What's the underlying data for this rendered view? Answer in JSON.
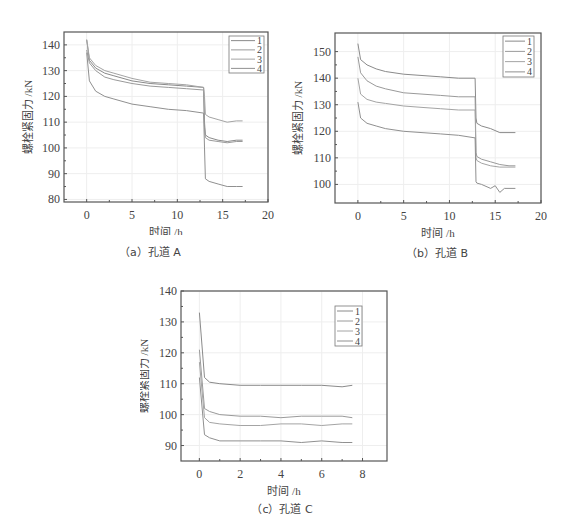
{
  "chart_data": [
    {
      "id": "A",
      "type": "line",
      "title": "",
      "caption": "（a）孔道 A",
      "xlabel": "时间 /h",
      "ylabel": "螺栓紧固力 /kN",
      "xlim": [
        -2.5,
        20
      ],
      "ylim": [
        79,
        145
      ],
      "xticks": [
        0,
        5,
        10,
        15,
        20
      ],
      "yticks": [
        80,
        90,
        100,
        110,
        120,
        130,
        140
      ],
      "grid": true,
      "legend_position": "upper right",
      "series": [
        {
          "name": "1",
          "x": [
            0,
            0.3,
            1,
            2,
            3,
            5,
            7,
            9,
            11,
            12.9,
            13.0,
            13.1,
            13.5,
            14.5,
            15.5,
            16.5,
            17.2
          ],
          "y": [
            142,
            134,
            131,
            129,
            128,
            126,
            125,
            124.5,
            124,
            123.5,
            110,
            105,
            104,
            103,
            102.5,
            103,
            103
          ]
        },
        {
          "name": "2",
          "x": [
            0,
            0.3,
            1,
            2,
            3,
            5,
            7,
            9,
            11,
            12.9,
            13.0,
            13.1,
            13.5,
            14.5,
            15.5,
            16.5,
            17.2
          ],
          "y": [
            138,
            133,
            130,
            127.5,
            126.5,
            125,
            124,
            123.5,
            123,
            122.5,
            108,
            104,
            103,
            102.5,
            102,
            102.5,
            102.5
          ]
        },
        {
          "name": "3",
          "x": [
            0,
            0.3,
            1,
            2,
            3,
            5,
            7,
            9,
            11,
            12.9,
            13.0,
            13.1,
            13.5,
            14.5,
            15.5,
            16.5,
            17.2
          ],
          "y": [
            142,
            135,
            132,
            130,
            129,
            127,
            125.5,
            125,
            124.5,
            123.5,
            120,
            113,
            112,
            111,
            110,
            110.5,
            110.5
          ]
        },
        {
          "name": "4",
          "x": [
            0,
            0.3,
            1,
            2,
            3,
            5,
            7,
            9,
            11,
            12.9,
            13.0,
            13.1,
            13.5,
            14.5,
            15.5,
            16.5,
            17.2
          ],
          "y": [
            137,
            126,
            122,
            120,
            119,
            117,
            116,
            115,
            114.5,
            113.5,
            100,
            88,
            87,
            86,
            85,
            85,
            85
          ]
        }
      ]
    },
    {
      "id": "B",
      "type": "line",
      "title": "",
      "caption": "（b）孔道 B",
      "xlabel": "时间 /h",
      "ylabel": "螺栓紧固力 /kN",
      "xlim": [
        -2.5,
        20
      ],
      "ylim": [
        93,
        157
      ],
      "xticks": [
        0,
        5,
        10,
        15,
        20
      ],
      "yticks": [
        100,
        110,
        120,
        130,
        140,
        150
      ],
      "grid": true,
      "legend_position": "upper right",
      "series": [
        {
          "name": "1",
          "x": [
            0,
            0.3,
            1,
            2,
            3,
            5,
            7,
            9,
            11,
            12.8,
            12.9,
            13.0,
            13.5,
            14.5,
            15.5,
            16.5,
            17.2
          ],
          "y": [
            153,
            147,
            145,
            143.5,
            142.5,
            141.5,
            141,
            140.5,
            140,
            140,
            125,
            123,
            122,
            121,
            119.5,
            119.5,
            119.5
          ]
        },
        {
          "name": "2",
          "x": [
            0,
            0.3,
            1,
            2,
            3,
            5,
            7,
            9,
            11,
            12.8,
            12.9,
            13.0,
            13.5,
            14.5,
            15.5,
            16.5,
            17.2
          ],
          "y": [
            148,
            142,
            139,
            137,
            136,
            134.5,
            134,
            133.5,
            133,
            133,
            112,
            110.5,
            109.5,
            108.5,
            107.5,
            107,
            107
          ]
        },
        {
          "name": "3",
          "x": [
            0,
            0.3,
            1,
            2,
            3,
            5,
            7,
            9,
            11,
            12.8,
            12.9,
            13.0,
            13.5,
            14.5,
            15.5,
            16.5,
            17.2
          ],
          "y": [
            140,
            134,
            132,
            131,
            130.5,
            129.5,
            129,
            128.5,
            128,
            128,
            110,
            109,
            108,
            107,
            106.5,
            106.5,
            106.5
          ]
        },
        {
          "name": "4",
          "x": [
            0,
            0.3,
            1,
            2,
            3,
            5,
            7,
            9,
            11,
            12.8,
            12.9,
            13.0,
            13.5,
            14.5,
            15.0,
            15.5,
            16.0,
            16.5,
            17.2
          ],
          "y": [
            131,
            125,
            123,
            122,
            121,
            120,
            119.5,
            119,
            118.5,
            117.5,
            101,
            100.5,
            100,
            98.5,
            99.5,
            97,
            98.5,
            98.5,
            98.5
          ]
        }
      ]
    },
    {
      "id": "C",
      "type": "line",
      "title": "",
      "caption": "（c）孔道 C",
      "xlabel": "时间 /h",
      "ylabel": "螺栓紧固力 /kN",
      "xlim": [
        -0.9,
        9.2
      ],
      "ylim": [
        85,
        140
      ],
      "xticks": [
        0,
        2,
        4,
        6,
        8
      ],
      "yticks": [
        90,
        100,
        110,
        120,
        130,
        140
      ],
      "grid": true,
      "legend_position": "upper right",
      "series": [
        {
          "name": "1",
          "x": [
            0,
            0.25,
            0.5,
            1,
            2,
            3,
            4,
            5,
            6,
            7,
            7.5
          ],
          "y": [
            133,
            112,
            110.5,
            110,
            109.5,
            109.5,
            109.5,
            109.5,
            109.5,
            109,
            109.5
          ]
        },
        {
          "name": "2",
          "x": [
            0,
            0.25,
            0.5,
            1,
            2,
            3,
            4,
            5,
            6,
            7,
            7.5
          ],
          "y": [
            121,
            102,
            101,
            100,
            99.5,
            99.5,
            99,
            99.5,
            99.5,
            99.5,
            99
          ]
        },
        {
          "name": "3",
          "x": [
            0,
            0.25,
            0.5,
            1,
            2,
            3,
            4,
            5,
            6,
            7,
            7.5
          ],
          "y": [
            117,
            99,
            97.5,
            97,
            96.5,
            96.5,
            97,
            97,
            96.5,
            97,
            97
          ]
        },
        {
          "name": "4",
          "x": [
            0,
            0.25,
            0.5,
            1,
            2,
            3,
            4,
            5,
            6,
            7,
            7.5
          ],
          "y": [
            112,
            93.5,
            92.5,
            91.5,
            91.5,
            91.5,
            91.5,
            91,
            91.5,
            91,
            91
          ]
        }
      ]
    }
  ],
  "colors": {
    "series": [
      "#8a8a8a",
      "#9a9a9a",
      "#a4a4a4",
      "#909090"
    ],
    "axis": "#555555",
    "grid": "#eeeeee"
  }
}
